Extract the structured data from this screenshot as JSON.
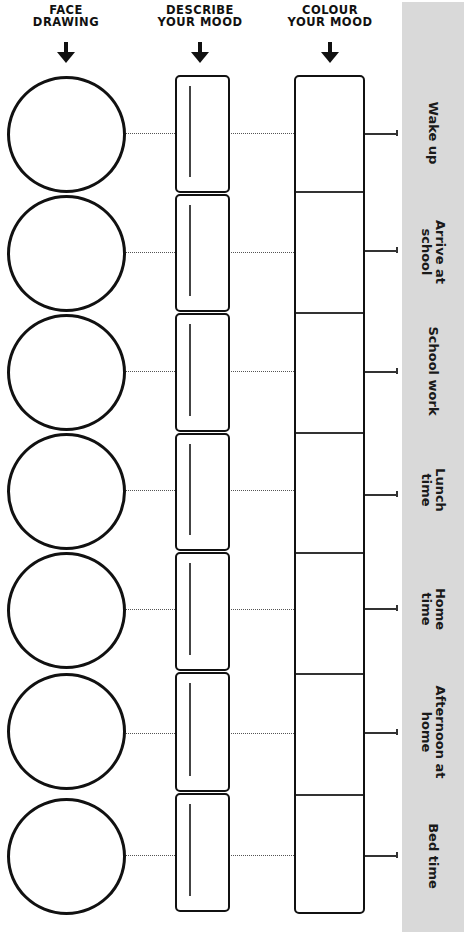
{
  "headers": {
    "face": {
      "line1": "FACE",
      "line2": "DRAWING"
    },
    "describe": {
      "line1": "DESCRIBE",
      "line2": "YOUR MOOD"
    },
    "colour": {
      "line1": "COLOUR",
      "line2": "YOUR MOOD"
    }
  },
  "icons": {
    "column_arrow": "arrow-down-icon"
  },
  "colors": {
    "ink": "#111111",
    "band": "#d9d9d9",
    "background": "#ffffff"
  },
  "rows": [
    {
      "line1": "Wake up",
      "line2": ""
    },
    {
      "line1": "Arrive at",
      "line2": "school"
    },
    {
      "line1": "School work",
      "line2": ""
    },
    {
      "line1": "Lunch",
      "line2": "time"
    },
    {
      "line1": "Home",
      "line2": "time"
    },
    {
      "line1": "Afternoon at",
      "line2": "home"
    },
    {
      "line1": "Bed time",
      "line2": ""
    }
  ]
}
